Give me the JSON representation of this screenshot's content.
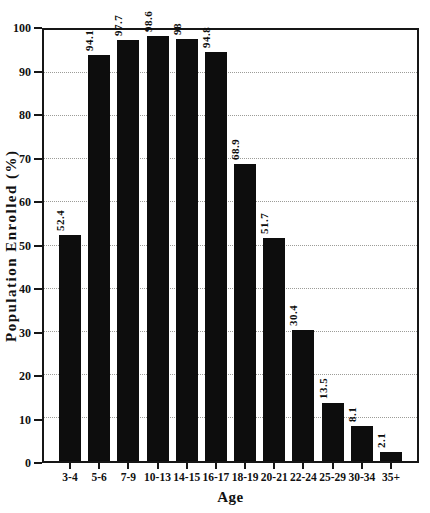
{
  "figure": {
    "background": "#ffffff",
    "bar_color": "#0d0d0d",
    "grid_color": "#9c9c98",
    "axis_color": "#161616"
  },
  "chart_data": {
    "type": "bar",
    "title": "",
    "xlabel": "Age",
    "ylabel": "Population Enrolled (%)",
    "categories": [
      "3-4",
      "5-6",
      "7-9",
      "10-13",
      "14-15",
      "16-17",
      "18-19",
      "20-21",
      "22-24",
      "25-29",
      "30-34",
      "35+"
    ],
    "values": [
      52.4,
      94.1,
      97.7,
      98.6,
      98,
      94.8,
      68.9,
      51.7,
      30.4,
      13.5,
      8.1,
      2.1
    ],
    "value_labels": [
      "52.4",
      "94.1",
      "97.7",
      "98.6",
      "98",
      "94.8",
      "68.9",
      "51.7",
      "30.4",
      "13.5",
      "8.1",
      "2.1"
    ],
    "ylim": [
      0,
      100
    ],
    "yticks": [
      0,
      10,
      20,
      30,
      40,
      50,
      60,
      70,
      80,
      90,
      100
    ],
    "grid": "horizontal-dotted",
    "legend": "none",
    "bar_labels_rotated": true
  }
}
